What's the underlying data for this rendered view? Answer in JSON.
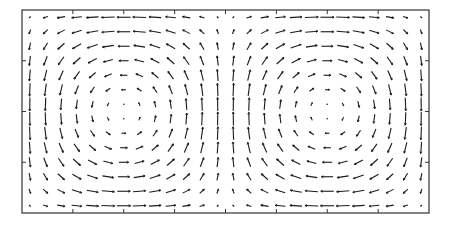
{
  "chart_data": {
    "type": "quiver",
    "title": "",
    "xlabel": "",
    "ylabel": "",
    "field": {
      "u": "sin(pi*x/L)*cos(pi*y/H)",
      "v": "-cos(pi*x/L)*sin(pi*y/H)",
      "x_range": [
        0,
        2
      ],
      "y_range": [
        0,
        1
      ],
      "cells": 2
    },
    "grid": {
      "columns": 26,
      "rows": 14
    },
    "xlim": [
      0,
      2
    ],
    "ylim": [
      0,
      1
    ],
    "axis_ticks_visible": true,
    "tick_labels": [],
    "colors": {
      "arrows": "#1a1a1a",
      "frame": "#333333",
      "background": "#ffffff"
    }
  }
}
